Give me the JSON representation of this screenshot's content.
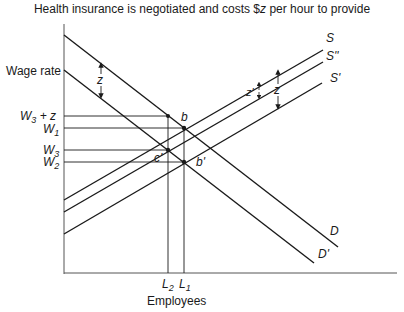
{
  "title": {
    "prefix": "Health insurance is negotiated and costs $",
    "var": "z",
    "suffix": " per hour to provide"
  },
  "axes": {
    "y_label": "Wage rate",
    "x_label": "Employees"
  },
  "y_ticks": {
    "w3z": "W3 + z",
    "w1": "W1",
    "w3": "W3",
    "w2": "W2"
  },
  "x_ticks": {
    "l2": "L2",
    "l1": "L1"
  },
  "curves": {
    "S": "S",
    "S_double": "S''",
    "S_prime": "S'",
    "D": "D",
    "D_prime": "D'"
  },
  "points": {
    "b": "b",
    "b_prime": "b'",
    "c_prime": "c'"
  },
  "annotations": {
    "z_demand": "z",
    "z_supply": "z",
    "z_prime_supply": "z'"
  },
  "colors": {
    "line": "#1a1a1a",
    "axis": "#555555"
  }
}
